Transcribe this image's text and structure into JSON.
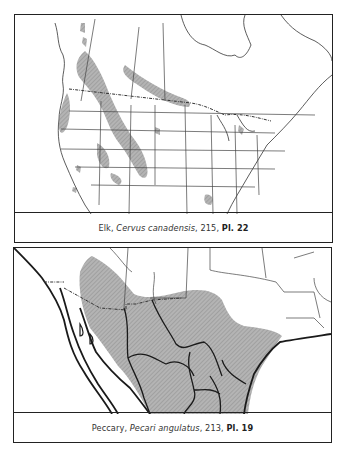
{
  "plates": [
    {
      "id": "elk",
      "caption": {
        "common_name": "Elk",
        "sep1": ", ",
        "scientific_name": "Cervus canadensis",
        "sep2": ", ",
        "page": "215",
        "sep3": ", ",
        "plate_ref": "Pl. 22"
      },
      "map_region": "North America (Canada and United States)",
      "range_fill_color": "#a8a8a8"
    },
    {
      "id": "peccary",
      "caption": {
        "common_name": "Peccary",
        "sep1": ", ",
        "scientific_name": "Pecari angulatus",
        "sep2": ", ",
        "page": "213",
        "sep3": ", ",
        "plate_ref": "Pl. 19"
      },
      "map_region": "Southwestern United States and Mexico",
      "range_fill_color": "#a8a8a8"
    }
  ]
}
